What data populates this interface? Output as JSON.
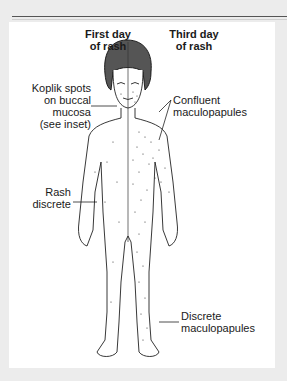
{
  "figure": {
    "column_headers": {
      "left": {
        "line1": "First day",
        "line2": "of rash"
      },
      "right": {
        "line1": "Third day",
        "line2": "of rash"
      }
    },
    "labels": {
      "koplik": {
        "line1": "Koplik spots",
        "line2": "on buccal mucosa",
        "line3": "(see inset)"
      },
      "confluent": {
        "line1": "Confluent",
        "line2": "maculopapules"
      },
      "rash_discrete": {
        "line1": "Rash",
        "line2": "discrete"
      },
      "discrete_maculopapules": {
        "line1": "Discrete",
        "line2": "maculopapules"
      }
    },
    "colors": {
      "background": "#ececec",
      "panel": "#ffffff",
      "ink": "#1a1a1a"
    }
  }
}
